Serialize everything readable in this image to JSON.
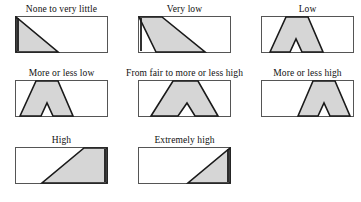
{
  "figure": {
    "title_present": false,
    "fill_color": "#d6d6d6",
    "outline_color": "#1a1a1a",
    "frame_color": "#555555",
    "background": "#ffffff"
  },
  "panels": [
    {
      "id": "none-to-very-little",
      "label": "None to very little",
      "shape": "right-triangle-left",
      "points": "1,1 1,36 43,36",
      "vertical_edge": "M 3,2 L 3,35"
    },
    {
      "id": "very-low",
      "label": "Very low",
      "shape": "slanted-parallelogram-left",
      "points": "1,1 24,1 67,36 18,36",
      "vertical_edge": "M 3,2 L 3,35"
    },
    {
      "id": "low",
      "label": "Low",
      "shape": "trapezoid-notched-left",
      "points": "9,36 25,1 47,1 62,36 41,36 35,23 29,36",
      "vertical_edge": ""
    },
    {
      "id": "more-or-less-low",
      "label": "More or less low",
      "shape": "trapezoid-notched-left",
      "points": "5,36 21,1 43,1 58,36 38,36 32,23 26,36",
      "vertical_edge": ""
    },
    {
      "id": "from-fair-to-more-or-less-high",
      "label": "From fair to more or less high",
      "shape": "trapezoid-notched-center",
      "points": "13,36 35,1 60,1 80,36 57,36 49,23 40,36",
      "vertical_edge": ""
    },
    {
      "id": "more-or-less-high",
      "label": "More or less high",
      "shape": "trapezoid-notched-right",
      "points": "37,36 52,1 74,1 89,36 69,36 63,23 57,36",
      "vertical_edge": ""
    },
    {
      "id": "high",
      "label": "High",
      "shape": "slanted-parallelogram-right",
      "points": "92,1 92,36 75,36 27,36 69,1",
      "vertical_edge": "M 90,2 L 90,35"
    },
    {
      "id": "extremely-high",
      "label": "Extremely high",
      "shape": "right-triangle-right",
      "points": "92,1 92,36 50,36",
      "vertical_edge": "M 90,2 L 90,35"
    }
  ],
  "layout": {
    "rows": [
      [
        "none-to-very-little",
        "very-low",
        "low"
      ],
      [
        "more-or-less-low",
        "from-fair-to-more-or-less-high",
        "more-or-less-high"
      ],
      [
        "high",
        "extremely-high"
      ]
    ]
  }
}
